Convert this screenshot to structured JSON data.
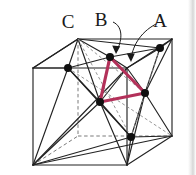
{
  "figure": {
    "background_color": "#ffffff",
    "line_color": "#222222",
    "dashed_color": "#6f6f6f",
    "highlight_color": "#b3315a",
    "atom_color": "#101010",
    "labels": [
      {
        "id": "label-c",
        "text": "C",
        "x": 68,
        "y": 28
      },
      {
        "id": "label-b",
        "text": "B",
        "x": 101,
        "y": 26
      },
      {
        "id": "label-a",
        "text": "A",
        "x": 160,
        "y": 27
      }
    ],
    "annotation_arrows": [
      {
        "id": "arrow-b",
        "from_label": "B",
        "to_atom": "atom-top-face-center",
        "path": "M 113 22 C 123 26 122 42 116 54",
        "tip": "M 116 54 L 112 46 L 120 46 Z"
      },
      {
        "id": "arrow-a",
        "from_label": "A",
        "to_atom": "atom-right-upper",
        "path": "M 156 24 C 140 32 132 48 131 62",
        "tip": "M 131 62 L 127 54 L 135 54 Z"
      }
    ],
    "cube_vertices": {
      "front_top_left": [
        33,
        68
      ],
      "front_top_right": [
        127,
        68
      ],
      "front_bottom_left": [
        33,
        165
      ],
      "front_bottom_right": [
        127,
        165
      ],
      "back_top_left": [
        78,
        39
      ],
      "back_top_right": [
        172,
        39
      ],
      "back_bottom_left": [
        78,
        136
      ],
      "back_bottom_right": [
        172,
        136
      ]
    },
    "face_center_atoms": [
      {
        "id": "atom-top-face-center",
        "label": "B",
        "x": 110,
        "y": 57
      },
      {
        "id": "atom-left-face-center",
        "label": "C",
        "x": 68,
        "y": 68
      },
      {
        "id": "atom-right-upper",
        "label": "A",
        "x": 160,
        "y": 48
      },
      {
        "id": "atom-cube-center",
        "label": "",
        "x": 100,
        "y": 102
      },
      {
        "id": "atom-right-face-center",
        "label": "",
        "x": 145,
        "y": 93
      },
      {
        "id": "atom-bottom-face-center",
        "label": "",
        "x": 131,
        "y": 137
      }
    ],
    "highlight_triangle": {
      "id": "plane-111-triangle",
      "vertices": [
        "atom-top-face-center",
        "atom-right-face-center",
        "atom-cube-center"
      ],
      "points": "110,57 145,93 100,102",
      "stroke_width": 3.2
    },
    "caption": ""
  }
}
